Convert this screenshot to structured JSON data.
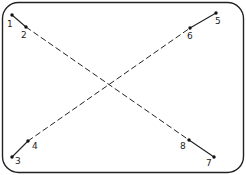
{
  "diagram": {
    "frame": {
      "x": 2.5,
      "y": 2.5,
      "w": 241,
      "h": 170,
      "r": 16,
      "stroke": "#222222"
    },
    "points": [
      {
        "id": "1",
        "x": 12,
        "y": 15,
        "lx": 7,
        "ly": 27
      },
      {
        "id": "2",
        "x": 26,
        "y": 27,
        "lx": 21,
        "ly": 38
      },
      {
        "id": "3",
        "x": 12,
        "y": 157,
        "lx": 15,
        "ly": 164
      },
      {
        "id": "4",
        "x": 28,
        "y": 141,
        "lx": 32,
        "ly": 149
      },
      {
        "id": "5",
        "x": 216,
        "y": 13,
        "lx": 215,
        "ly": 24
      },
      {
        "id": "6",
        "x": 190,
        "y": 28,
        "lx": 187,
        "ly": 39
      },
      {
        "id": "7",
        "x": 214,
        "y": 157,
        "lx": 206,
        "ly": 166
      },
      {
        "id": "8",
        "x": 189,
        "y": 140,
        "lx": 180,
        "ly": 149
      }
    ],
    "solid_segments": [
      [
        "1",
        "2"
      ],
      [
        "3",
        "4"
      ],
      [
        "5",
        "6"
      ],
      [
        "8",
        "7"
      ]
    ],
    "dashed_segments": [
      [
        "2",
        "8"
      ],
      [
        "4",
        "6"
      ]
    ]
  },
  "labels": {
    "p1": "1",
    "p2": "2",
    "p3": "3",
    "p4": "4",
    "p5": "5",
    "p6": "6",
    "p7": "7",
    "p8": "8"
  }
}
